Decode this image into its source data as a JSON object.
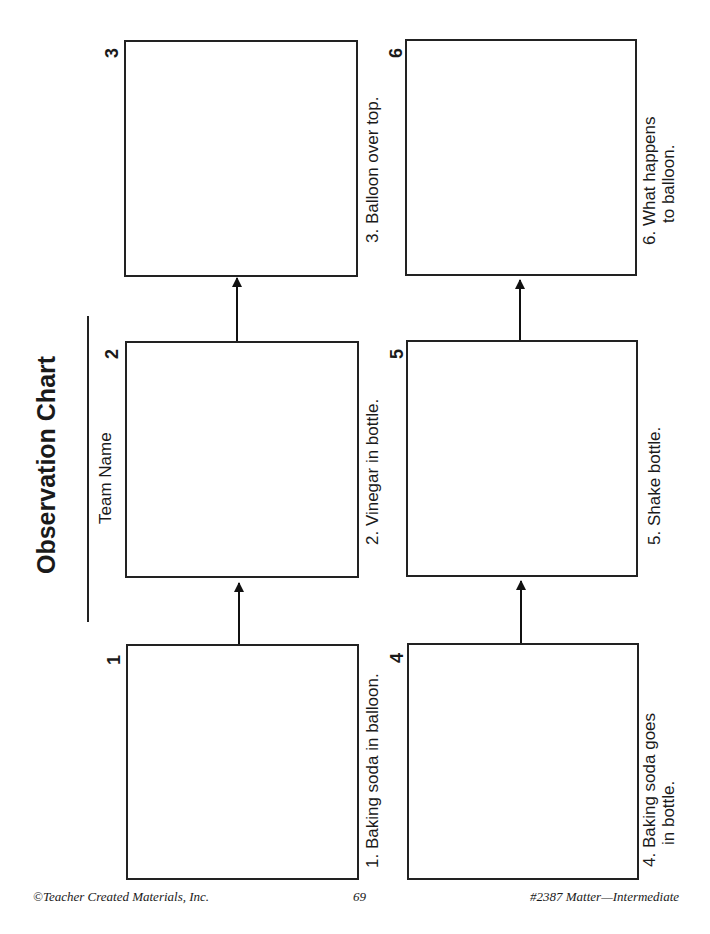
{
  "title": "Observation Chart",
  "team_label": "Team Name",
  "steps": [
    {
      "number": "1",
      "caption_lines": [
        "1.  Baking soda in balloon."
      ]
    },
    {
      "number": "2",
      "caption_lines": [
        "2.  Vinegar in bottle."
      ]
    },
    {
      "number": "3",
      "caption_lines": [
        "3.  Balloon over top."
      ]
    },
    {
      "number": "4",
      "caption_lines": [
        "4.  Baking soda goes",
        "in bottle."
      ]
    },
    {
      "number": "5",
      "caption_lines": [
        "5.  Shake bottle."
      ]
    },
    {
      "number": "6",
      "caption_lines": [
        "6.  What happens",
        "to balloon."
      ]
    }
  ],
  "footer": {
    "left": "©Teacher Created Materials, Inc.",
    "center": "69",
    "right": "#2387 Matter—Intermediate"
  }
}
